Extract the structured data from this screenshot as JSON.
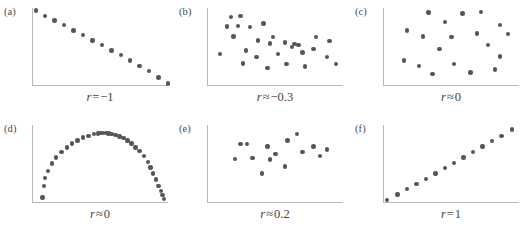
{
  "figure": {
    "dot_color": "#565658",
    "axis_color": "#b4b8bc",
    "background": "#ffffff"
  },
  "chart_data": {
    "type": "scatter",
    "title": "",
    "xlabel": "",
    "ylabel": "",
    "grid": false,
    "legend": "none",
    "axis_ticks": "none",
    "xlim": [
      0,
      1
    ],
    "ylim": [
      0,
      1
    ],
    "panel_layout": {
      "rows": 2,
      "cols": 3
    },
    "panels": [
      {
        "letter": "(a)",
        "caption": "r = −1",
        "caption_parts": {
          "symbol": "r",
          "operator": "=",
          "value": "−1"
        },
        "correlation": -1,
        "description": "perfect negative linear relationship",
        "n_points": 15,
        "x": [
          0.02,
          0.09,
          0.16,
          0.23,
          0.3,
          0.37,
          0.44,
          0.51,
          0.58,
          0.65,
          0.72,
          0.79,
          0.86,
          0.93,
          1.0
        ],
        "y": [
          0.97,
          0.9,
          0.84,
          0.78,
          0.71,
          0.65,
          0.58,
          0.52,
          0.45,
          0.39,
          0.32,
          0.25,
          0.18,
          0.1,
          0.02
        ]
      },
      {
        "letter": "(b)",
        "caption": "r ≈ −0.3",
        "caption_parts": {
          "symbol": "r",
          "operator": "≈",
          "value": "−0.3"
        },
        "correlation": -0.3,
        "description": "weak negative correlation, diffuse cloud",
        "n_points": 28,
        "x": [
          0.17,
          0.24,
          0.14,
          0.22,
          0.31,
          0.41,
          0.19,
          0.28,
          0.37,
          0.46,
          0.48,
          0.57,
          0.52,
          0.62,
          0.64,
          0.67,
          0.7,
          0.78,
          0.8,
          0.88,
          0.9,
          0.09,
          0.26,
          0.36,
          0.44,
          0.58,
          0.72,
          0.95
        ],
        "y": [
          0.88,
          0.9,
          0.76,
          0.77,
          0.75,
          0.8,
          0.63,
          0.45,
          0.58,
          0.54,
          0.62,
          0.55,
          0.4,
          0.49,
          0.53,
          0.52,
          0.42,
          0.47,
          0.62,
          0.36,
          0.57,
          0.4,
          0.28,
          0.36,
          0.22,
          0.27,
          0.24,
          0.27
        ]
      },
      {
        "letter": "(c)",
        "caption": "r ≈ 0",
        "caption_parts": {
          "symbol": "r",
          "operator": "≈",
          "value": "0"
        },
        "correlation": 0,
        "description": "no correlation, uniformly scattered points",
        "n_points": 19,
        "x": [
          0.33,
          0.45,
          0.58,
          0.72,
          0.17,
          0.86,
          0.29,
          0.5,
          0.69,
          0.92,
          0.41,
          0.77,
          0.86,
          0.15,
          0.26,
          0.52,
          0.36,
          0.64,
          0.82
        ],
        "y": [
          0.94,
          0.82,
          0.93,
          0.95,
          0.71,
          0.78,
          0.63,
          0.62,
          0.67,
          0.66,
          0.47,
          0.52,
          0.37,
          0.32,
          0.25,
          0.27,
          0.14,
          0.16,
          0.2
        ]
      },
      {
        "letter": "(d)",
        "caption": "r ≈ 0",
        "caption_parts": {
          "symbol": "r",
          "operator": "≈",
          "value": "0"
        },
        "correlation": 0,
        "description": "strong nonlinear relationship, semicircular dome",
        "n_points": 35,
        "x": [
          0.07,
          0.08,
          0.09,
          0.11,
          0.14,
          0.17,
          0.21,
          0.25,
          0.29,
          0.33,
          0.37,
          0.41,
          0.45,
          0.48,
          0.5,
          0.52,
          0.54,
          0.56,
          0.58,
          0.61,
          0.64,
          0.67,
          0.7,
          0.73,
          0.76,
          0.79,
          0.82,
          0.85,
          0.87,
          0.89,
          0.91,
          0.93,
          0.95,
          0.96,
          0.97
        ],
        "y": [
          0.06,
          0.21,
          0.31,
          0.4,
          0.5,
          0.58,
          0.65,
          0.71,
          0.76,
          0.8,
          0.84,
          0.86,
          0.88,
          0.89,
          0.9,
          0.9,
          0.9,
          0.89,
          0.88,
          0.87,
          0.85,
          0.83,
          0.8,
          0.76,
          0.71,
          0.66,
          0.6,
          0.52,
          0.45,
          0.37,
          0.29,
          0.21,
          0.14,
          0.09,
          0.04
        ]
      },
      {
        "letter": "(e)",
        "caption": "r ≈ 0.2",
        "caption_parts": {
          "symbol": "r",
          "operator": "≈",
          "value": "0.2"
        },
        "correlation": 0.2,
        "description": "weak positive correlation, small cluster",
        "n_points": 15,
        "x": [
          0.24,
          0.29,
          0.44,
          0.59,
          0.66,
          0.78,
          0.2,
          0.33,
          0.5,
          0.57,
          0.7,
          0.83,
          0.88,
          0.46,
          0.4
        ],
        "y": [
          0.75,
          0.75,
          0.72,
          0.8,
          0.88,
          0.72,
          0.56,
          0.57,
          0.62,
          0.46,
          0.65,
          0.6,
          0.68,
          0.55,
          0.37
        ]
      },
      {
        "letter": "(f)",
        "caption": "r = 1",
        "caption_parts": {
          "symbol": "r",
          "operator": "=",
          "value": "1"
        },
        "correlation": 1,
        "description": "perfect positive linear relationship",
        "n_points": 14,
        "x": [
          0.02,
          0.1,
          0.17,
          0.24,
          0.31,
          0.38,
          0.45,
          0.52,
          0.59,
          0.66,
          0.73,
          0.8,
          0.87,
          0.95
        ],
        "y": [
          0.03,
          0.1,
          0.17,
          0.23,
          0.3,
          0.37,
          0.44,
          0.51,
          0.58,
          0.65,
          0.72,
          0.79,
          0.86,
          0.94
        ]
      }
    ]
  }
}
